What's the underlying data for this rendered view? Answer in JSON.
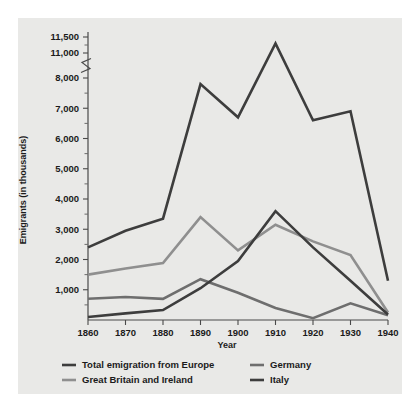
{
  "figure": {
    "background": "#e9e9e7",
    "page_background": "#ffffff"
  },
  "chart_data": {
    "type": "line",
    "title": "",
    "subtitle": "",
    "xlabel": "Year",
    "ylabel": "Emigrants (in thousands)",
    "x": [
      1860,
      1870,
      1880,
      1890,
      1900,
      1910,
      1920,
      1930,
      1940
    ],
    "x_tick_labels": [
      "1860",
      "1870",
      "1880",
      "1890",
      "1900",
      "1910",
      "1920",
      "1930",
      "1940"
    ],
    "xlim": [
      1860,
      1940
    ],
    "y_tick_labels": [
      "1,000",
      "2,000",
      "3,000",
      "4,000",
      "5,000",
      "6,000",
      "7,000",
      "8,000",
      "11,000",
      "11,500"
    ],
    "y_tick_values": [
      1000,
      2000,
      3000,
      4000,
      5000,
      6000,
      7000,
      8000,
      11000,
      11500
    ],
    "y_minor_tick_values": [
      500,
      1500,
      2500,
      3500,
      4500,
      5500,
      6500,
      7500,
      11250
    ],
    "ylim": [
      0,
      11500
    ],
    "axis_break": {
      "present": true,
      "between": [
        8000,
        11000
      ],
      "label": "axis-break-symbol"
    },
    "grid": false,
    "legend_position": "bottom",
    "series": [
      {
        "name": "Total emigration from Europe",
        "color": "#3d3d3d",
        "width": 2.6,
        "values": [
          2400,
          2950,
          3350,
          7800,
          6700,
          11300,
          8900,
          6900,
          1300
        ]
      },
      {
        "name": "Great Britain and Ireland",
        "color": "#8f8f8f",
        "width": 2.6,
        "values": [
          1500,
          1700,
          1880,
          3400,
          2300,
          3150,
          2600,
          2150,
          250
        ]
      },
      {
        "name": "Germany",
        "color": "#6e6e6e",
        "width": 2.6,
        "values": [
          700,
          760,
          700,
          1350,
          900,
          400,
          60,
          550,
          160
        ]
      },
      {
        "name": "Italy",
        "color": "#3d3d3d",
        "width": 2.6,
        "values": [
          100,
          220,
          330,
          1050,
          1950,
          3600,
          2400,
          1300,
          180
        ]
      }
    ]
  },
  "legend": {
    "entries": [
      {
        "label": "Total emigration from Europe",
        "color": "#3d3d3d"
      },
      {
        "label": "Great Britain and Ireland",
        "color": "#8f8f8f"
      },
      {
        "label": "Germany",
        "color": "#6e6e6e"
      },
      {
        "label": "Italy",
        "color": "#3d3d3d"
      }
    ]
  }
}
